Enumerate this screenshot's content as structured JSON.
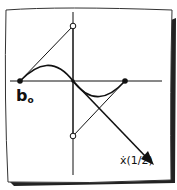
{
  "diagram": {
    "labels": {
      "start_point": "b",
      "start_point_sub": "o",
      "tangent_label": "ẋ(1/2)"
    },
    "points": [
      {
        "name": "b0",
        "style": "filled"
      },
      {
        "name": "b1",
        "style": "open"
      },
      {
        "name": "b2",
        "style": "open"
      },
      {
        "name": "b3",
        "style": "filled"
      }
    ],
    "colors": {
      "ink": "#111111",
      "paper": "#ffffff",
      "shadow": "#222222"
    }
  }
}
